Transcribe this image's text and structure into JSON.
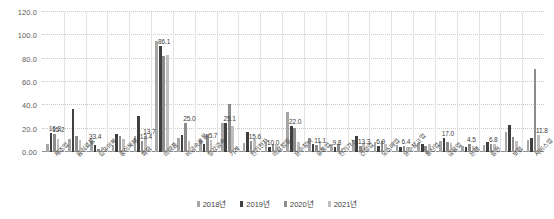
{
  "chart_data": {
    "type": "bar",
    "title": "",
    "xlabel": "",
    "ylabel": "",
    "ylim": [
      0,
      120
    ],
    "grid": true,
    "legend_position": "bottom",
    "ytick_labels": [
      "0.00",
      "20.0",
      "40.0",
      "60.0",
      "80.0",
      "100.0",
      "120.0"
    ],
    "ytick_values": [
      0,
      20,
      40,
      60,
      80,
      100,
      120
    ],
    "categories": [
      "제조업",
      "음식료품",
      "섬유의복",
      "종이목재",
      "화학",
      "의약품",
      "비금속광물",
      "철강금속",
      "기계",
      "전기전자",
      "의료정밀",
      "운수장비",
      "유통업",
      "전기가스",
      "건설업",
      "도소매업",
      "운수창고업",
      "통신업",
      "금융업",
      "은행",
      "증권",
      "보험",
      "서비스업"
    ],
    "series": [
      {
        "name": "2018년",
        "color": "#a6a6a6",
        "values": [
          7.2,
          11.2,
          9.5,
          6.0,
          13.4,
          95.0,
          12.3,
          10.5,
          25.1,
          7.4,
          8.9,
          34.0,
          11.8,
          6.5,
          10.5,
          8.2,
          6.3,
          7.5,
          9.2,
          5.5,
          6.2,
          17.0,
          10.5
        ]
      },
      {
        "name": "2019년",
        "color": "#3f3f3f",
        "values": [
          16.3,
          36.5,
          6.0,
          15.5,
          30.8,
          90.5,
          14.2,
          7.0,
          25.1,
          17.5,
          4.5,
          22.0,
          6.8,
          4.0,
          13.3,
          5.5,
          4.0,
          6.5,
          11.8,
          4.5,
          9.0,
          23.5,
          11.8
        ]
      },
      {
        "name": "2020년",
        "color": "#8c8c8c",
        "values": [
          15.2,
          13.8,
          2.5,
          13.4,
          9.5,
          82.0,
          25.0,
          15.6,
          41.0,
          9.8,
          6.9,
          20.5,
          5.8,
          7.2,
          5.5,
          9.5,
          5.3,
          4.8,
          8.8,
          6.8,
          7.2,
          13.0,
          71.5
        ]
      },
      {
        "name": "2021년",
        "color": "#bfbfbf",
        "values": [
          11.5,
          10.2,
          4.2,
          11.0,
          13.7,
          83.5,
          9.5,
          10.0,
          22.0,
          11.1,
          6.4,
          8.5,
          9.5,
          3.8,
          8.0,
          7.0,
          4.2,
          6.8,
          7.6,
          5.0,
          6.8,
          9.5,
          15.0
        ]
      }
    ],
    "annotations": [
      {
        "category_index": 0,
        "series_index": 1,
        "text": "16.3"
      },
      {
        "category_index": 0,
        "series_index": 2,
        "text": "15.2"
      },
      {
        "category_index": 2,
        "series_index": 0,
        "text": "33.4"
      },
      {
        "category_index": 4,
        "series_index": 2,
        "text": "13.4"
      },
      {
        "category_index": 4,
        "series_index": 3,
        "text": "13.7"
      },
      {
        "category_index": 5,
        "series_index": 1,
        "text": "86.1"
      },
      {
        "category_index": 6,
        "series_index": 2,
        "text": "25.0"
      },
      {
        "category_index": 7,
        "series_index": 3,
        "text": "5.7"
      },
      {
        "category_index": 8,
        "series_index": 1,
        "text": "25.1"
      },
      {
        "category_index": 9,
        "series_index": 2,
        "text": "15.6"
      },
      {
        "category_index": 10,
        "series_index": 1,
        "text": "10.0"
      },
      {
        "category_index": 11,
        "series_index": 1,
        "text": "22.0"
      },
      {
        "category_index": 12,
        "series_index": 2,
        "text": "11.1"
      },
      {
        "category_index": 13,
        "series_index": 1,
        "text": "9.8"
      },
      {
        "category_index": 14,
        "series_index": 2,
        "text": "13.3"
      },
      {
        "category_index": 15,
        "series_index": 1,
        "text": "6.9"
      },
      {
        "category_index": 16,
        "series_index": 2,
        "text": "6.4"
      },
      {
        "category_index": 18,
        "series_index": 1,
        "text": "17.0"
      },
      {
        "category_index": 19,
        "series_index": 2,
        "text": "4.5"
      },
      {
        "category_index": 20,
        "series_index": 2,
        "text": "6.8"
      },
      {
        "category_index": 22,
        "series_index": 3,
        "text": "11.8"
      }
    ]
  },
  "legend": {
    "items": [
      {
        "label": "2018년",
        "color": "#a6a6a6"
      },
      {
        "label": "2019년",
        "color": "#3f3f3f"
      },
      {
        "label": "2020년",
        "color": "#8c8c8c"
      },
      {
        "label": "2021년",
        "color": "#bfbfbf"
      }
    ]
  }
}
